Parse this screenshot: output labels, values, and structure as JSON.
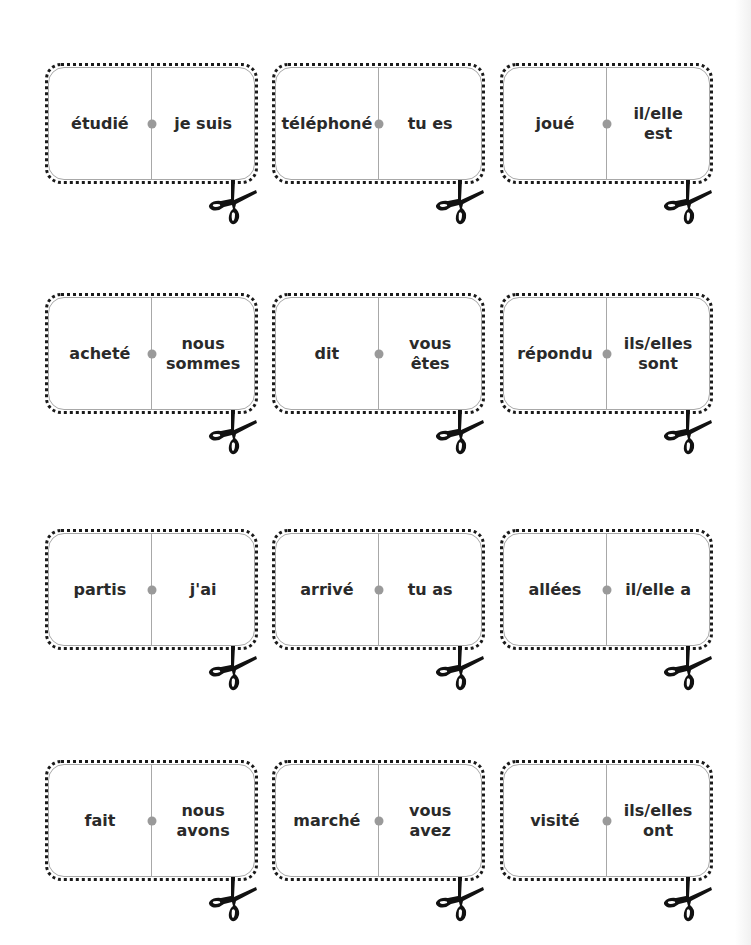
{
  "sheet": {
    "colors": {
      "text": "#2a2a2a",
      "divider": "#a8a8a8",
      "pip": "#9a9a9a",
      "dots": "#1a1a1a"
    },
    "icons": {
      "cut_marker": "scissors-icon",
      "center_dot": "pip"
    },
    "dominoes": [
      {
        "left": "étudié",
        "right": "je suis"
      },
      {
        "left": "téléphoné",
        "right": "tu es"
      },
      {
        "left": "joué",
        "right": "il/elle\nest"
      },
      {
        "left": "acheté",
        "right": "nous\nsommes"
      },
      {
        "left": "dit",
        "right": "vous\nêtes"
      },
      {
        "left": "répondu",
        "right": "ils/elles\nsont"
      },
      {
        "left": "partis",
        "right": "j'ai"
      },
      {
        "left": "arrivé",
        "right": "tu as"
      },
      {
        "left": "allées",
        "right": "il/elle a"
      },
      {
        "left": "fait",
        "right": "nous\navons"
      },
      {
        "left": "marché",
        "right": "vous\navez"
      },
      {
        "left": "visité",
        "right": "ils/elles\nont"
      }
    ]
  }
}
